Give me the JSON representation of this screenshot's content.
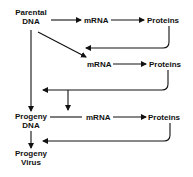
{
  "diagram": {
    "type": "flowchart",
    "colors": {
      "ink": "#111111",
      "background": "#ffffff"
    },
    "nodes": {
      "parental_dna": {
        "line1": "Parental",
        "line2": "DNA"
      },
      "mrna_1": {
        "label": "mRNA"
      },
      "proteins_1": {
        "label": "Proteins"
      },
      "mrna_2": {
        "label": "mRNA"
      },
      "proteins_2": {
        "label": "Proteins"
      },
      "progeny_dna": {
        "line1": "Progeny",
        "line2": "DNA"
      },
      "mrna_3": {
        "label": "mRNA"
      },
      "proteins_3": {
        "label": "Proteins"
      },
      "progeny_virus": {
        "line1": "Progeny",
        "line2": "Virus"
      }
    },
    "edges": [
      {
        "from": "Parental DNA",
        "to": "mRNA (1)"
      },
      {
        "from": "mRNA (1)",
        "to": "Proteins (1)"
      },
      {
        "from": "Proteins (1)",
        "to": "Parental DNA → mRNA (2) arrow"
      },
      {
        "from": "Parental DNA",
        "to": "mRNA (2)"
      },
      {
        "from": "mRNA (2)",
        "to": "Proteins (2)"
      },
      {
        "from": "Proteins (2)",
        "to": "Parental DNA → Progeny DNA line"
      },
      {
        "from": "Proteins (2) feedback",
        "to": "Progeny DNA → mRNA (3) line"
      },
      {
        "from": "Parental DNA",
        "to": "Progeny DNA"
      },
      {
        "from": "Progeny DNA",
        "to": "mRNA (3)"
      },
      {
        "from": "mRNA (3)",
        "to": "Proteins (3)"
      },
      {
        "from": "Proteins (3)",
        "to": "Progeny DNA → Progeny Virus arrow"
      },
      {
        "from": "Progeny DNA",
        "to": "Progeny Virus"
      }
    ]
  }
}
